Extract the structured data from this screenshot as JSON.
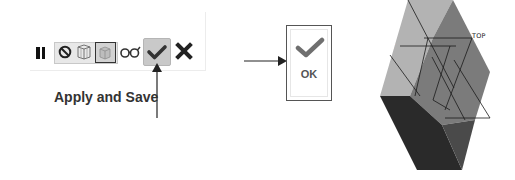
{
  "toolbar": {
    "icons": [
      {
        "name": "pause-icon"
      },
      {
        "name": "no-hidden-icon"
      },
      {
        "name": "wireframe-icon"
      },
      {
        "name": "shaded-icon"
      },
      {
        "name": "glasses-view-icon"
      },
      {
        "name": "apply-save-check-icon",
        "state": "active"
      },
      {
        "name": "cancel-x-icon"
      }
    ],
    "apply_label": "Apply and Save"
  },
  "ok_dialog": {
    "label": "OK"
  },
  "view_cube": {
    "labels": {
      "front": "FRONT",
      "top": "TOP",
      "right": "RIGHT"
    },
    "colors": {
      "front_face": "#b3b3b3",
      "top_face": "#7c7c7c",
      "right_face": "#2c2c2c"
    }
  }
}
